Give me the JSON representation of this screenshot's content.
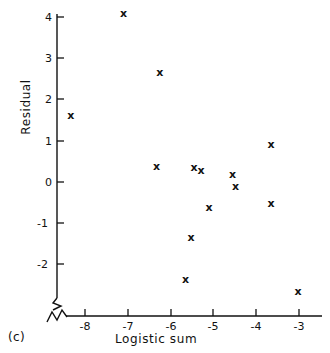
{
  "panel": {
    "label": "(c)"
  },
  "chart_data": {
    "type": "scatter",
    "title": "",
    "xlabel": "Logistic sum",
    "ylabel": "Residual",
    "xlim": [
      -8.75,
      -2.7
    ],
    "ylim": [
      -2.75,
      4.3
    ],
    "xticks": [
      -8,
      -7,
      -6,
      -5,
      -4,
      -3
    ],
    "xticklabels": [
      "-8",
      "-7",
      "-6",
      "-5",
      "-4",
      "-3"
    ],
    "yticks": [
      -2,
      -1,
      0,
      1,
      2,
      3,
      4
    ],
    "yticklabels": [
      "-2",
      "-1",
      "0",
      "1",
      "2",
      "3",
      "4"
    ],
    "grid": false,
    "legend": null,
    "marker": "x",
    "axis_break_x": true,
    "axis_break_y": true,
    "points": [
      {
        "x": -7.1,
        "y": 4.08
      },
      {
        "x": -6.25,
        "y": 2.66
      },
      {
        "x": -8.33,
        "y": 1.62
      },
      {
        "x": -3.65,
        "y": 0.9
      },
      {
        "x": -6.33,
        "y": 0.38
      },
      {
        "x": -5.45,
        "y": 0.36
      },
      {
        "x": -5.29,
        "y": 0.28
      },
      {
        "x": -4.55,
        "y": 0.17
      },
      {
        "x": -4.48,
        "y": -0.1
      },
      {
        "x": -3.65,
        "y": -0.51
      },
      {
        "x": -5.1,
        "y": -0.62
      },
      {
        "x": -5.52,
        "y": -1.34
      },
      {
        "x": -5.65,
        "y": -2.37
      },
      {
        "x": -3.02,
        "y": -2.65
      }
    ]
  }
}
